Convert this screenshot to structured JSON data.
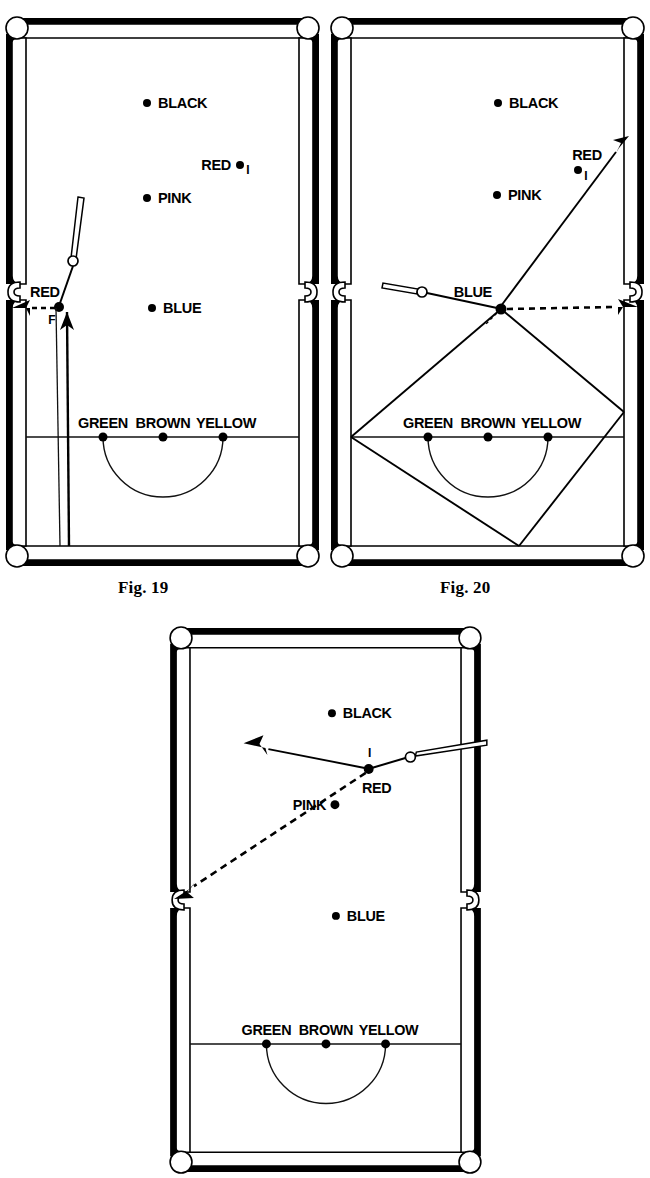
{
  "document": {
    "kind": "snooker-coaching-diagrams",
    "figure_count": 3
  },
  "captions": {
    "fig19": "Fig. 19",
    "fig20": "Fig. 20"
  },
  "ball_labels": {
    "black": "BLACK",
    "red": "RED",
    "pink": "PINK",
    "blue": "BLUE",
    "green": "GREEN",
    "brown": "BROWN",
    "yellow": "YELLOW"
  },
  "annotations": {
    "point_f": "F",
    "tick_mark": "I"
  },
  "colors": {
    "ink": "#000000",
    "cloth": "#ffffff",
    "cushion": "#000000",
    "line": "#111111"
  },
  "figures": [
    {
      "id": "fig19",
      "caption": "Fig. 19",
      "description": "Cue ball played up the table off the bottom cushion; RED at F is cut into the middle left pocket.",
      "balls": [
        {
          "name": "BLACK",
          "label": "BLACK",
          "label_side": "right"
        },
        {
          "name": "RED",
          "label": "RED",
          "label_side": "left",
          "has_tick": true
        },
        {
          "name": "PINK",
          "label": "PINK",
          "label_side": "right"
        },
        {
          "name": "BLUE",
          "label": "BLUE",
          "label_side": "right"
        },
        {
          "name": "GREEN",
          "label": "GREEN",
          "label_side": "above"
        },
        {
          "name": "BROWN",
          "label": "BROWN",
          "label_side": "above"
        },
        {
          "name": "YELLOW",
          "label": "YELLOW",
          "label_side": "above"
        },
        {
          "name": "RED_F",
          "label": "RED",
          "label_side": "above",
          "annotation": "F"
        }
      ],
      "shots": [
        {
          "style": "solid",
          "kind": "travel",
          "note": "cue ball path up the table"
        },
        {
          "style": "dashed",
          "kind": "object",
          "note": "RED into middle left pocket"
        }
      ]
    },
    {
      "id": "fig20",
      "caption": "Fig. 20",
      "description": "BLUE potted in the middle right pocket; the cue ball runs round the diamond off three cushions.",
      "balls": [
        {
          "name": "BLACK",
          "label": "BLACK",
          "label_side": "right"
        },
        {
          "name": "RED",
          "label": "RED",
          "label_side": "left",
          "has_tick": true
        },
        {
          "name": "PINK",
          "label": "PINK",
          "label_side": "right"
        },
        {
          "name": "BLUE",
          "label": "BLUE",
          "label_side": "left"
        },
        {
          "name": "GREEN",
          "label": "GREEN",
          "label_side": "above"
        },
        {
          "name": "BROWN",
          "label": "BROWN",
          "label_side": "above"
        },
        {
          "name": "YELLOW",
          "label": "YELLOW",
          "label_side": "above"
        }
      ],
      "shots": [
        {
          "style": "dashed",
          "kind": "object",
          "note": "BLUE into middle right pocket"
        },
        {
          "style": "solid",
          "kind": "travel",
          "note": "cue ball diamond path off three cushions"
        }
      ]
    },
    {
      "id": "fig21",
      "caption": "",
      "description": "RED cut from near the right cushion down into the middle left pocket; cue ball goes away to the left.",
      "balls": [
        {
          "name": "BLACK",
          "label": "BLACK",
          "label_side": "right"
        },
        {
          "name": "RED",
          "label": "RED",
          "label_side": "below",
          "has_tick": true
        },
        {
          "name": "PINK",
          "label": "PINK",
          "label_side": "left"
        },
        {
          "name": "BLUE",
          "label": "BLUE",
          "label_side": "right"
        },
        {
          "name": "GREEN",
          "label": "GREEN",
          "label_side": "above"
        },
        {
          "name": "BROWN",
          "label": "BROWN",
          "label_side": "above"
        },
        {
          "name": "YELLOW",
          "label": "YELLOW",
          "label_side": "above"
        }
      ],
      "shots": [
        {
          "style": "solid",
          "kind": "travel",
          "note": "cue ball away to the left"
        },
        {
          "style": "dashed",
          "kind": "object",
          "note": "RED into middle left pocket"
        }
      ]
    }
  ]
}
